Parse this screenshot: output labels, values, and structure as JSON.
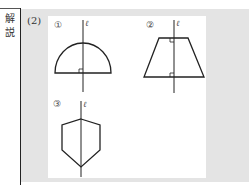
{
  "side_label": {
    "line1": "解",
    "line2": "説"
  },
  "part_label": "(2)",
  "figures": [
    {
      "id": "1",
      "label": "①",
      "axis_label": "ℓ",
      "shape": "semicircle",
      "right_angle_marks": 1
    },
    {
      "id": "2",
      "label": "②",
      "axis_label": "ℓ",
      "shape": "isosceles trapezoid",
      "right_angle_marks": 2
    },
    {
      "id": "3",
      "label": "③",
      "axis_label": "ℓ",
      "shape": "pentagon",
      "right_angle_marks": 0
    }
  ],
  "colors": {
    "panel_grey": "#e4e4e4",
    "line": "#222222"
  }
}
